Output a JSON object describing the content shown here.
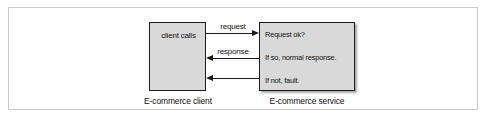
{
  "figure": {
    "type": "sequence-flow-diagram",
    "frame": {
      "border_color": "#c9c9c9"
    },
    "colors": {
      "box_fill": "#d9d9d9",
      "box_border": "#1c1c1c",
      "arrow": "#1a1a1a",
      "text": "#111111"
    },
    "nodes": [
      {
        "id": "client",
        "label": "client calls",
        "caption": "E-commerce client"
      },
      {
        "id": "service",
        "lines": [
          "Request ok?",
          "If so, normal response.",
          "If not, fault."
        ],
        "caption": "E-commerce service"
      }
    ],
    "arrows": [
      {
        "id": "request",
        "label": "request",
        "direction": "right",
        "from": "client",
        "to": "service"
      },
      {
        "id": "response",
        "label": "response",
        "direction": "left",
        "from": "service",
        "to": "client"
      },
      {
        "id": "fault",
        "label": "",
        "direction": "left",
        "from": "service",
        "to": "client"
      }
    ]
  }
}
